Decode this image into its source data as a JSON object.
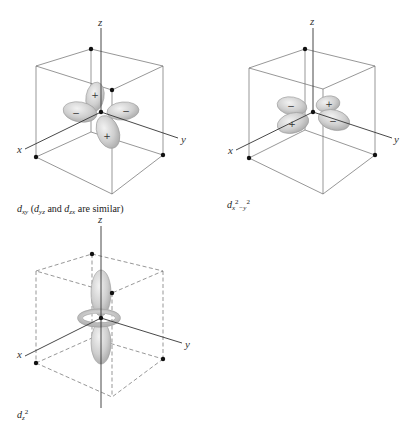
{
  "figure": {
    "panels": [
      {
        "id": "dxy",
        "caption": {
          "main_symbol": "d",
          "main_subscript": "xy",
          "note_open": "(",
          "note_sym1": "d",
          "note_sub1": "yz",
          "note_and": "and",
          "note_sym2": "d",
          "note_sub2": "zx",
          "note_tail": "are similar)"
        },
        "axes": {
          "x": "x",
          "y": "y",
          "z": "z"
        },
        "lobe_signs": [
          "+",
          "−",
          "−",
          "+"
        ],
        "cube_style": "solid"
      },
      {
        "id": "dx2-y2",
        "caption": {
          "main_symbol": "d",
          "sub_x": "x",
          "sup_2a": "2",
          "sub_minus_y": "−y",
          "sup_2b": "2"
        },
        "axes": {
          "x": "x",
          "y": "y",
          "z": "z"
        },
        "lobe_signs": [
          "−",
          "+",
          "+",
          "−"
        ],
        "cube_style": "solid"
      },
      {
        "id": "dz2",
        "caption": {
          "main_symbol": "d",
          "sub_z": "z",
          "sup_2": "2"
        },
        "axes": {
          "x": "x",
          "y": "y",
          "z": "z"
        },
        "cube_style": "dashed"
      }
    ],
    "colors": {
      "line": "#555555",
      "axis": "#333333",
      "lobe_fill": "#c8c8c8",
      "lobe_edge": "#9a9a9a",
      "dot": "#111111"
    }
  }
}
